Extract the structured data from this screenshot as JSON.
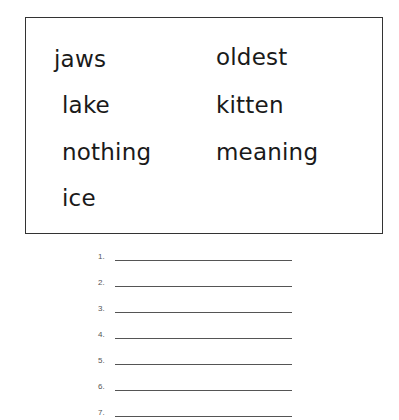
{
  "word_box": {
    "left_column": [
      "jaws",
      "lake",
      "nothing",
      "ice"
    ],
    "right_column": [
      "oldest",
      "kitten",
      "meaning"
    ]
  },
  "answer_lines": [
    "1.",
    "2.",
    "3.",
    "4.",
    "5.",
    "6.",
    "7."
  ]
}
